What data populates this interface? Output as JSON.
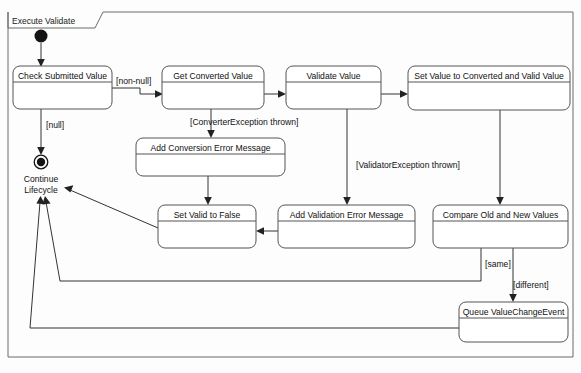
{
  "frame": {
    "title": "Execute Validate",
    "border_color": "#6b6b6b"
  },
  "nodes": {
    "initial": {
      "name": "initial-node",
      "label": ""
    },
    "final": {
      "name": "final-node",
      "label_line1": "Continue",
      "label_line2": "Lifecycle"
    }
  },
  "activities": [
    {
      "id": "check-submitted-value",
      "label": "Check Submitted Value",
      "x": 13,
      "y": 66,
      "w": 99,
      "h": 43
    },
    {
      "id": "get-converted-value",
      "label": "Get Converted Value",
      "x": 162,
      "y": 66,
      "w": 102,
      "h": 43
    },
    {
      "id": "validate-value",
      "label": "Validate Value",
      "x": 286,
      "y": 66,
      "w": 95,
      "h": 43
    },
    {
      "id": "set-value-to-converted-and-valid-value",
      "label": "Set Value to Converted and Valid Value",
      "x": 408,
      "y": 66,
      "w": 162,
      "h": 44
    },
    {
      "id": "add-conversion-error-message",
      "label": "Add Conversion Error Message",
      "x": 136,
      "y": 138,
      "w": 149,
      "h": 38
    },
    {
      "id": "set-valid-to-false",
      "label": "Set Valid to False",
      "x": 158,
      "y": 205,
      "w": 98,
      "h": 43
    },
    {
      "id": "add-validation-error-message",
      "label": "Add Validation Error Message",
      "x": 278,
      "y": 205,
      "w": 137,
      "h": 43
    },
    {
      "id": "compare-old-and-new-values",
      "label": "Compare Old and New Values",
      "x": 433,
      "y": 205,
      "w": 135,
      "h": 43
    },
    {
      "id": "queue-valuechangeevent",
      "label": "Queue ValueChangeEvent",
      "x": 459,
      "y": 302,
      "w": 109,
      "h": 40
    }
  ],
  "guards": [
    {
      "id": "guard-non-null",
      "text": "[non-null]",
      "x": 116,
      "y": 84
    },
    {
      "id": "guard-null",
      "text": "[null]",
      "x": 46,
      "y": 128
    },
    {
      "id": "guard-converter-exception",
      "text": "[ConverterException thrown]",
      "x": 190,
      "y": 125
    },
    {
      "id": "guard-validator-exception",
      "text": "[ValidatorException thrown]",
      "x": 356,
      "y": 168
    },
    {
      "id": "guard-same",
      "text": "[same]",
      "x": 485,
      "y": 267
    },
    {
      "id": "guard-different",
      "text": "[different]",
      "x": 513,
      "y": 288
    }
  ],
  "colors": {
    "frame_stroke": "#6b6b6b",
    "box_stroke": "#555555",
    "flow_stroke": "#333333",
    "text": "#111111",
    "background": "#fdfdfd"
  }
}
